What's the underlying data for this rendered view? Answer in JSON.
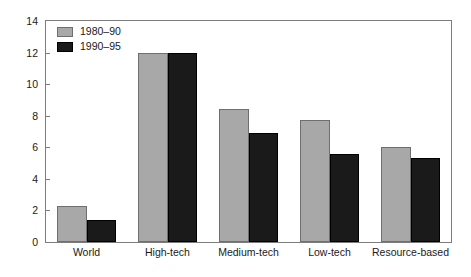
{
  "chart_data": {
    "type": "bar",
    "title": "",
    "subtitle": "",
    "xlabel": "",
    "ylabel": "",
    "categories": [
      "World",
      "High-tech",
      "Medium-tech",
      "Low-tech",
      "Resource-based"
    ],
    "series": [
      {
        "name": "1980–90",
        "color": "#a8a8a8",
        "values": [
          2.3,
          12.0,
          8.4,
          7.7,
          6.0
        ]
      },
      {
        "name": "1990–95",
        "color": "#1a1a1a",
        "values": [
          1.4,
          12.0,
          6.9,
          5.6,
          5.3
        ]
      }
    ],
    "ylim": [
      0,
      14
    ],
    "yticks": [
      0,
      2,
      4,
      6,
      8,
      10,
      12,
      14
    ],
    "ytick_labels": [
      "0",
      "2",
      "4",
      "6",
      "8",
      "10",
      "12",
      "14"
    ],
    "grid": false,
    "legend_position": "top-left",
    "axis_color": "#7d7d7d",
    "background": "#ffffff"
  }
}
